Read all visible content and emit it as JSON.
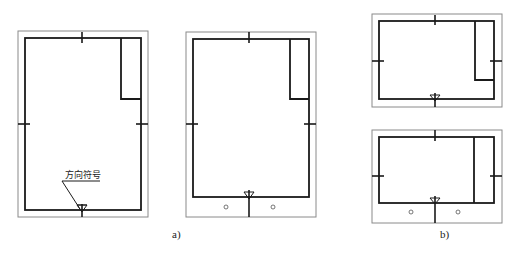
{
  "figure": {
    "annotation": "方向符号",
    "labels": {
      "a": "a)",
      "b": "b)"
    },
    "colors": {
      "border": "#1a1a1a",
      "trim": "#8a8a8a",
      "background": "#ffffff"
    }
  },
  "sheets": [
    {
      "id": "a1",
      "orientation": "portrait",
      "title_block": "top-right",
      "binding_margin": false,
      "direction_symbol": true
    },
    {
      "id": "a2",
      "orientation": "portrait",
      "title_block": "top-right",
      "binding_margin": true,
      "holes": 2
    },
    {
      "id": "b1",
      "orientation": "landscape",
      "title_block": "right-partial",
      "binding_margin": false
    },
    {
      "id": "b2",
      "orientation": "landscape",
      "title_block": "right-full",
      "binding_margin": true,
      "holes": 2
    }
  ]
}
